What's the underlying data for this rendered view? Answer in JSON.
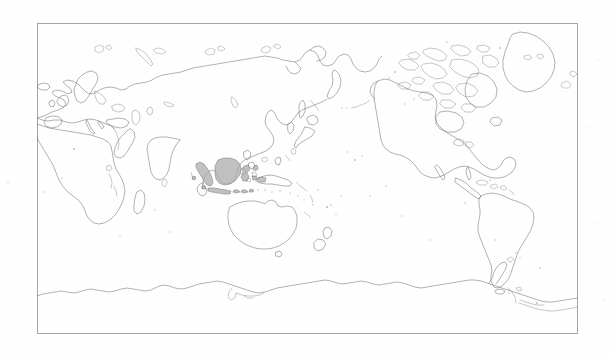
{
  "document": {
    "type": "map-figure",
    "title": "World map outline",
    "projection": "Pacific-centered equirectangular world map",
    "background_color": "#fefefe",
    "page_width": 612,
    "page_height": 355
  },
  "map": {
    "name": "world-outline-map",
    "frame": {
      "x": 37,
      "y": 23,
      "width": 540,
      "height": 310,
      "stroke_color": "#9a9c9e",
      "stroke_width": 0.9
    },
    "coastline_color": "#6f7172",
    "fill_color": "#ffffff",
    "highlight": {
      "region": "Indonesia",
      "color": "#a9a9a9",
      "stroke_color": "#6a6c6e",
      "description": "Indonesian archipelago shaded gray: Sumatra, Java, Borneo/Kalimantan, Sulawesi, Lesser Sunda Islands, Maluku"
    },
    "landmasses": [
      "Africa",
      "Europe",
      "Asia",
      "Siberia",
      "Arabian Peninsula",
      "Indian Subcontinent",
      "Southeast Asia",
      "Indonesia",
      "Philippines",
      "Japan",
      "Korea",
      "Australia",
      "New Guinea",
      "New Zealand",
      "Greenland",
      "North America",
      "Canadian Arctic Archipelago",
      "Central America",
      "Caribbean",
      "South America",
      "Antarctica",
      "Madagascar",
      "British Isles",
      "Scandinavia",
      "Iceland",
      "Svalbard",
      "Novaya Zemlya",
      "Sakhalin",
      "Kamchatka",
      "Sri Lanka",
      "Taiwan",
      "Tierra del Fuego",
      "Falkland Islands",
      "Hawaii",
      "Fiji",
      "Solomon Islands",
      "Tasmania"
    ],
    "grid": "none",
    "labels": "none",
    "legend": "none"
  }
}
